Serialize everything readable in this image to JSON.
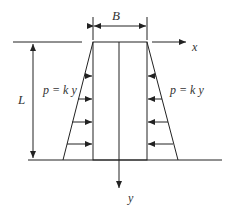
{
  "diagram": {
    "labels": {
      "width": "B",
      "length": "L",
      "x_axis": "x",
      "y_axis": "y",
      "load_left": "p = k y",
      "load_right": "p = k y"
    },
    "colors": {
      "line": "#222222",
      "text": "#333333",
      "background": "#ffffff"
    },
    "load_arrow_count_per_side": 4
  }
}
